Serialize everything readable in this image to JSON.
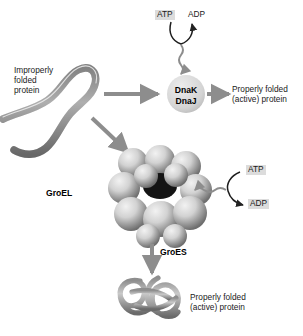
{
  "figure": {
    "background": "#ffffff",
    "arrow_color": "#8d8d8d",
    "chip_color": "#dcdcdc",
    "sphere_light": "#e3e3e3",
    "sphere_dark": "#6f6f6f",
    "cavity_color": "#141414"
  },
  "labels": {
    "improperly_folded": "Improperly\nfolded\nprotein",
    "dnak": "DnaK",
    "dnaj": "DnaJ",
    "properly_folded_top": "Properly folded\n(active) protein",
    "groel": "GroEL",
    "groes": "GroES",
    "properly_folded_bottom": "Properly folded\n(active) protein",
    "atp_top": "ATP",
    "adp_top": "ADP",
    "atp_right": "ATP",
    "adp_right": "ADP"
  }
}
